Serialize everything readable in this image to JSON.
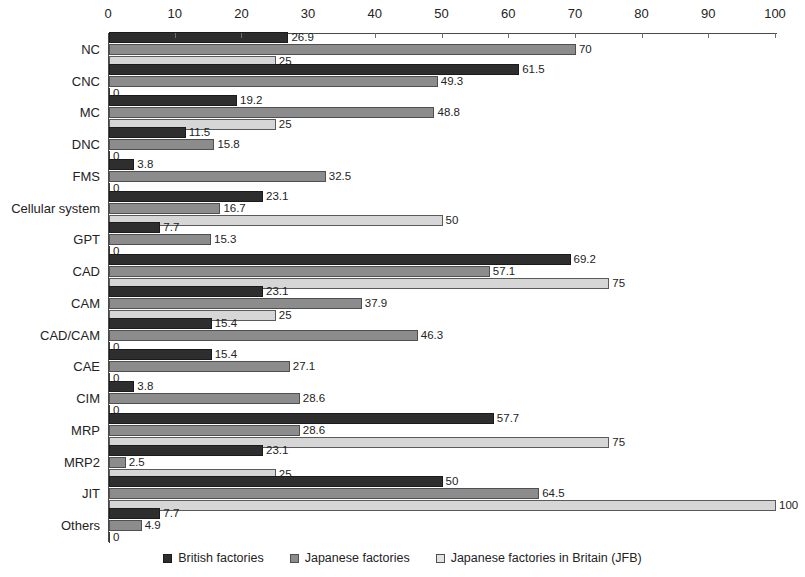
{
  "chart_data": {
    "type": "bar",
    "orientation": "horizontal",
    "title": "",
    "xlabel": "",
    "ylabel": "",
    "xlim": [
      0,
      100
    ],
    "xticks": [
      0,
      10,
      20,
      30,
      40,
      50,
      60,
      70,
      80,
      90,
      100
    ],
    "grid": false,
    "legend_position": "bottom",
    "categories": [
      "NC",
      "CNC",
      "MC",
      "DNC",
      "FMS",
      "Cellular system",
      "GPT",
      "CAD",
      "CAM",
      "CAD/CAM",
      "CAE",
      "CIM",
      "MRP",
      "MRP2",
      "JIT",
      "Others"
    ],
    "series": [
      {
        "name": "British factories",
        "color": "#2e2e2e",
        "values": [
          26.9,
          61.5,
          19.2,
          11.5,
          3.8,
          23.1,
          7.7,
          69.2,
          23.1,
          15.4,
          15.4,
          3.8,
          57.7,
          23.1,
          50,
          7.7
        ],
        "labels": [
          "26.9",
          "61.5",
          "19.2",
          "11.5",
          "3.8",
          "23.1",
          "7.7",
          "69.2",
          "23.1",
          "15.4",
          "15.4",
          "3.8",
          "57.7",
          "23.1",
          "50",
          "7.7"
        ]
      },
      {
        "name": "Japanese factories",
        "color": "#8c8c8c",
        "values": [
          70,
          49.3,
          48.8,
          15.8,
          32.5,
          16.7,
          15.3,
          57.1,
          37.9,
          46.3,
          27.1,
          28.6,
          28.6,
          2.5,
          64.5,
          4.9
        ],
        "labels": [
          "70",
          "49.3",
          "48.8",
          "15.8",
          "32.5",
          "16.7",
          "15.3",
          "57.1",
          "37.9",
          "46.3",
          "27.1",
          "28.6",
          "28.6",
          "2.5",
          "64.5",
          "4.9"
        ]
      },
      {
        "name": "Japanese factories in Britain (JFB)",
        "color": "#d6d6d6",
        "values": [
          25,
          0,
          25,
          0,
          0,
          50,
          0,
          75,
          25,
          0,
          0,
          0,
          75,
          25,
          100,
          0
        ],
        "labels": [
          "25",
          "0",
          "25",
          "0",
          "0",
          "50",
          "0",
          "75",
          "25",
          "0",
          "0",
          "0",
          "75",
          "25",
          "100",
          "0"
        ]
      }
    ]
  },
  "legend": {
    "items": [
      {
        "label": "British factories",
        "swatch": "legend-swatch-british"
      },
      {
        "label": "Japanese factories",
        "swatch": "legend-swatch-japanese"
      },
      {
        "label": "Japanese factories in Britain (JFB)",
        "swatch": "legend-swatch-jfb"
      }
    ]
  }
}
